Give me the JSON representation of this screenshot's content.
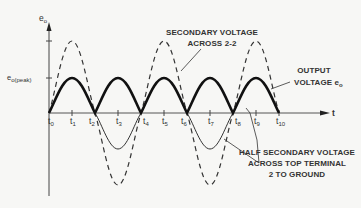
{
  "diagram": {
    "type": "waveform",
    "y_axis": {
      "label": "e",
      "label_sub": "o",
      "peak_label": "e",
      "peak_label_sub": "o(peak)"
    },
    "x_axis": {
      "label": "t"
    },
    "ticks": [
      {
        "name": "t",
        "sub": "0"
      },
      {
        "name": "t",
        "sub": "1"
      },
      {
        "name": "t",
        "sub": "2"
      },
      {
        "name": "t",
        "sub": "3"
      },
      {
        "name": "t",
        "sub": "4"
      },
      {
        "name": "t",
        "sub": "5"
      },
      {
        "name": "t",
        "sub": "6"
      },
      {
        "name": "t",
        "sub": "7"
      },
      {
        "name": "t",
        "sub": "8"
      },
      {
        "name": "t",
        "sub": "9"
      },
      {
        "name": "t",
        "sub": "10"
      }
    ],
    "annotations": {
      "secondary": {
        "line1": "SECONDARY VOLTAGE",
        "line2": "ACROSS 2-2"
      },
      "output": {
        "line1": "OUTPUT",
        "line2": "VOLTAGE e",
        "line2_sub": "o"
      },
      "half_secondary": {
        "line1": "HALF SECONDARY VOLTAGE",
        "line2": "ACROSS TOP TERMINAL",
        "line3": "2 TO GROUND"
      }
    },
    "series": [
      {
        "name": "Secondary voltage across 2-2",
        "style": "dashed"
      },
      {
        "name": "Output voltage eo (full-wave rectified)",
        "style": "solid-bold"
      },
      {
        "name": "Half secondary voltage across top terminal 2 to ground",
        "style": "solid-thin"
      }
    ],
    "colors": {
      "ink": "#222222",
      "background": "#f7f7f5",
      "axis": "#555555"
    }
  }
}
